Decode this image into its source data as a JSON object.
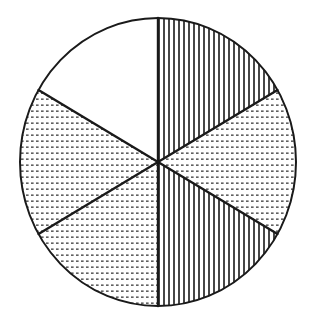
{
  "diagram": {
    "type": "fraction-circle",
    "total_sectors": 6,
    "center": [
      158,
      162
    ],
    "radius_x": 138,
    "radius_y": 144,
    "stroke_color": "#1a1a1a",
    "background_color": "#ffffff",
    "sectors": [
      {
        "index": 1,
        "start_deg": 0,
        "end_deg": 60,
        "pattern": "vertical-stripes",
        "position": "upper-right"
      },
      {
        "index": 2,
        "start_deg": 60,
        "end_deg": 120,
        "pattern": "dotted",
        "position": "right"
      },
      {
        "index": 3,
        "start_deg": 120,
        "end_deg": 180,
        "pattern": "vertical-stripes",
        "position": "lower-right"
      },
      {
        "index": 4,
        "start_deg": 180,
        "end_deg": 240,
        "pattern": "dotted",
        "position": "lower-left"
      },
      {
        "index": 5,
        "start_deg": 240,
        "end_deg": 300,
        "pattern": "dotted",
        "position": "left"
      },
      {
        "index": 6,
        "start_deg": 300,
        "end_deg": 360,
        "pattern": "blank",
        "position": "upper-left"
      }
    ],
    "pattern_counts": {
      "vertical-stripes": 2,
      "dotted": 3,
      "blank": 1
    }
  }
}
